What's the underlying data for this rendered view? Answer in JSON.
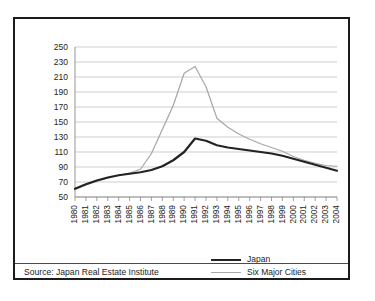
{
  "figure": {
    "source_note": "Source: Japan Real Estate Institute"
  },
  "legend": {
    "position": "bottom-right",
    "items": [
      {
        "label": "Japan",
        "color": "#232323",
        "style": "thick-solid"
      },
      {
        "label": "Six Major Cities",
        "color": "#a8a8a8",
        "style": "thin-solid"
      }
    ]
  },
  "chart_data": {
    "type": "line",
    "title": "",
    "subtitle": "",
    "xlabel": "",
    "ylabel": "",
    "grid": true,
    "legend_position": "bottom-right",
    "xlim": [
      1980,
      2004
    ],
    "ylim": [
      50,
      250
    ],
    "ytick_step": 20,
    "yticks": [
      50,
      70,
      90,
      110,
      130,
      150,
      170,
      190,
      210,
      230,
      250
    ],
    "ytick_labels": [
      "50",
      "70",
      "90",
      "110",
      "130",
      "150",
      "170",
      "190",
      "210",
      "230",
      "250"
    ],
    "x": [
      1980,
      1981,
      1982,
      1983,
      1984,
      1985,
      1986,
      1987,
      1988,
      1989,
      1990,
      1991,
      1992,
      1993,
      1994,
      1995,
      1996,
      1997,
      1998,
      1999,
      2000,
      2001,
      2002,
      2003,
      2004
    ],
    "xtick_labels": [
      "1980",
      "1981",
      "1982",
      "1983",
      "1984",
      "1985",
      "1986",
      "1987",
      "1988",
      "1989",
      "1990",
      "1991",
      "1992",
      "1993",
      "1994",
      "1995",
      "1996",
      "1997",
      "1998",
      "1999",
      "2000",
      "2001",
      "2002",
      "2003",
      "2004"
    ],
    "series": [
      {
        "name": "Japan",
        "color": "#232323",
        "values": [
          61,
          67,
          72,
          76,
          79,
          81,
          83,
          86,
          91,
          99,
          110,
          128,
          125,
          119,
          116,
          114,
          112,
          110,
          108,
          105,
          101,
          97,
          93,
          89,
          85
        ]
      },
      {
        "name": "Six Major Cities",
        "color": "#a8a8a8",
        "values": [
          60,
          66,
          71,
          75,
          79,
          82,
          87,
          108,
          140,
          172,
          215,
          224,
          197,
          155,
          143,
          134,
          127,
          121,
          116,
          111,
          104,
          99,
          95,
          92,
          91
        ]
      }
    ]
  }
}
